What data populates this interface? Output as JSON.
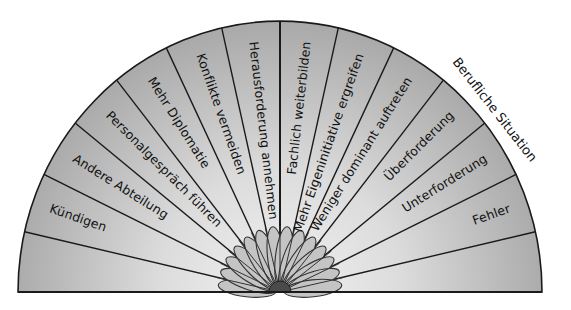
{
  "diagram": {
    "title": "Berufliche Situation",
    "segment_count": 14,
    "segments": [
      {
        "label": ""
      },
      {
        "label": "Kündigen"
      },
      {
        "label": "Andere Abteilung"
      },
      {
        "label": "Personalgespräch führen"
      },
      {
        "label": "Mehr Diplomatie"
      },
      {
        "label": "Konflikte vermeiden"
      },
      {
        "label": "Herausforderung annehmen"
      },
      {
        "label": "Fachlich weiterbilden"
      },
      {
        "label": "Mehr Eigeninitiative ergreifen"
      },
      {
        "label": "Weniger dominant auftreten"
      },
      {
        "label": "Überforderung"
      },
      {
        "label": "Unterforderung"
      },
      {
        "label": "Fehler"
      },
      {
        "label": ""
      }
    ],
    "colors": {
      "fill_inner": "#f2f2f2",
      "fill_outer": "#a9a9a9",
      "petal_fill": "#c4c4c4",
      "petal_stroke": "#333333",
      "hub_fill": "#4a4a4a",
      "line": "#1a1a1a"
    }
  }
}
